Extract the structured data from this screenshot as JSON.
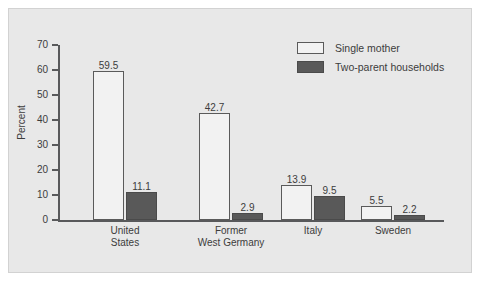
{
  "chart_data": {
    "type": "bar",
    "title": "",
    "xlabel": "",
    "ylabel": "Percent",
    "ylim": [
      0,
      70
    ],
    "yticks": [
      "0",
      "10",
      "20",
      "30",
      "40",
      "50",
      "60",
      "70"
    ],
    "grid": false,
    "legend_position": "top-right",
    "categories": [
      "United States",
      "Former West Germany",
      "Italy",
      "Sweden"
    ],
    "category_lines": [
      [
        "United",
        "States"
      ],
      [
        "Former",
        "West Germany"
      ],
      [
        "Italy"
      ],
      [
        "Sweden"
      ]
    ],
    "series": [
      {
        "name": "Single mother",
        "color": "#f2f2f2",
        "edge_color": "#5a5a5a",
        "values": [
          59.5,
          42.7,
          13.9,
          5.5
        ],
        "value_labels": [
          "59.5",
          "42.7",
          "13.9",
          "5.5"
        ]
      },
      {
        "name": "Two-parent households",
        "color": "#595959",
        "edge_color": "#4a4a4a",
        "values": [
          11.1,
          2.9,
          9.5,
          2.2
        ],
        "value_labels": [
          "11.1",
          "2.9",
          "9.5",
          "2.2"
        ]
      }
    ]
  },
  "figure": {
    "background_color": "#e8e8e8",
    "border_color": "#d2d2d2",
    "axis_color": "#58595b",
    "text_color": "#3c3c3c"
  }
}
